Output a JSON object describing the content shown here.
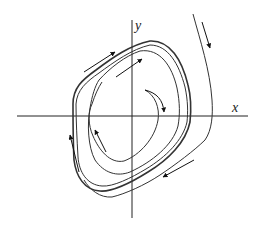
{
  "diagram": {
    "type": "phase-portrait",
    "axes": {
      "x_label": "x",
      "y_label": "y"
    },
    "colors": {
      "background": "#ffffff",
      "stroke": "#333333",
      "arrow": "#111111"
    },
    "curves": [
      {
        "name": "limit-cycle",
        "description": "closed orbit (bold, multiple traces)"
      },
      {
        "name": "inner-spiral",
        "description": "trajectory spiraling outward from near the origin"
      },
      {
        "name": "outer-trajectory",
        "description": "trajectory entering from upper right, approaching cycle from outside"
      }
    ],
    "arrows": [
      {
        "name": "arrow-top-left-outer",
        "direction": "up-right"
      },
      {
        "name": "arrow-top-inner",
        "direction": "up-right"
      },
      {
        "name": "arrow-center",
        "direction": "down"
      },
      {
        "name": "arrow-inner-left",
        "direction": "up-left"
      },
      {
        "name": "arrow-left",
        "direction": "up"
      },
      {
        "name": "arrow-bottom-right",
        "direction": "down-left"
      },
      {
        "name": "arrow-upper-right",
        "direction": "down"
      }
    ]
  }
}
